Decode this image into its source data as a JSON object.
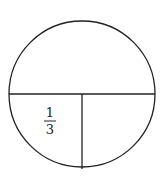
{
  "diagram": {
    "type": "circle-partition",
    "stroke_color": "#222222",
    "regions": [
      {
        "name": "upper-half",
        "label": ""
      },
      {
        "name": "lower-left-quarter",
        "label_numerator": "1",
        "label_denominator": "3"
      },
      {
        "name": "lower-right-quarter",
        "label": ""
      }
    ]
  }
}
